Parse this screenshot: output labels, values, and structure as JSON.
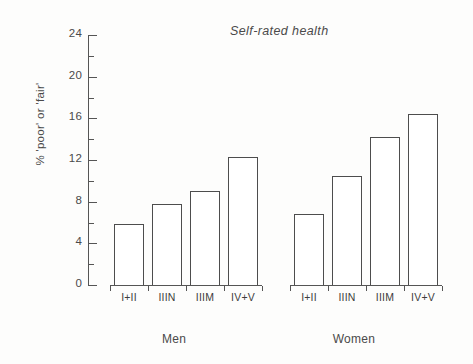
{
  "chart_data": {
    "type": "bar",
    "title": "Self-rated health",
    "xlabel": "",
    "ylabel": "% 'poor' or 'fair'",
    "ylim": [
      0,
      24
    ],
    "yticks": [
      0,
      4,
      8,
      12,
      16,
      20,
      24
    ],
    "ytick_labels": [
      "0",
      "4",
      "8",
      "12",
      "16",
      "20",
      "24"
    ],
    "minor_yticks": [
      2,
      6,
      10,
      14,
      18,
      22
    ],
    "grid": false,
    "legend": "none",
    "categories": [
      "I+II",
      "IIIN",
      "IIIM",
      "IV+V"
    ],
    "groups": [
      "Men",
      "Women"
    ],
    "series": [
      {
        "name": "Men",
        "values": [
          5.9,
          7.8,
          9.0,
          12.3
        ]
      },
      {
        "name": "Women",
        "values": [
          6.8,
          10.5,
          14.2,
          16.4
        ]
      }
    ]
  },
  "colors": {
    "bar_outline": "#4d4d4d",
    "bar_fill": "#ffffff",
    "axis": "#555555",
    "text": "#4a4a4a",
    "background": "#fdfdfc"
  }
}
